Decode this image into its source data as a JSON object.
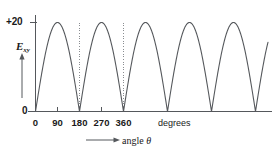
{
  "chart_data": {
    "type": "line",
    "title": "",
    "subtitle": "",
    "xlabel": "angle θ",
    "ylabel": "E",
    "ylabel_subscript": "xy",
    "xunit": "degrees",
    "xlim": [
      -10,
      810
    ],
    "ylim": [
      0,
      20
    ],
    "xticks": [
      0,
      90,
      180,
      270,
      360
    ],
    "xticklabels": [
      "0",
      "90",
      "180",
      "270",
      "360"
    ],
    "yticks": [
      0,
      20
    ],
    "yticklabels": [
      "0",
      "+20"
    ],
    "grid": false,
    "legend": null,
    "curve_description": "full-wave rectified sine: E = 20 |sin(θ)|",
    "amplitude": 20,
    "period_degrees": 180,
    "peaks_at_degrees": [
      0,
      180,
      360,
      540,
      720
    ],
    "zeros_at_degrees": [
      90,
      270,
      450,
      630
    ],
    "annotation_lines_degrees": [
      180,
      360
    ],
    "annotation_line_style": "dotted",
    "series": [
      {
        "name": "E_xy",
        "x": [
          0,
          10,
          20,
          30,
          40,
          50,
          60,
          70,
          80,
          90,
          100,
          110,
          120,
          130,
          140,
          150,
          160,
          170,
          180,
          190,
          200,
          210,
          220,
          230,
          240,
          250,
          260,
          270,
          280,
          290,
          300,
          310,
          320,
          330,
          340,
          350,
          360,
          370,
          380,
          390,
          400,
          410,
          420,
          430,
          440,
          450,
          460,
          470,
          480,
          490,
          500,
          510,
          520,
          530,
          540,
          550,
          560,
          570,
          580,
          590,
          600,
          610,
          620,
          630,
          640,
          650,
          660,
          670,
          680,
          690,
          700,
          710,
          720,
          730,
          740,
          750,
          760,
          770,
          780,
          790,
          800,
          810
        ],
        "y": [
          20.0,
          19.7,
          18.8,
          17.3,
          15.3,
          12.9,
          10.0,
          6.8,
          3.5,
          0.0,
          3.5,
          6.8,
          10.0,
          12.9,
          15.3,
          17.3,
          18.8,
          19.7,
          20.0,
          19.7,
          18.8,
          17.3,
          15.3,
          12.9,
          10.0,
          6.8,
          3.5,
          0.0,
          3.5,
          6.8,
          10.0,
          12.9,
          15.3,
          17.3,
          18.8,
          19.7,
          20.0,
          19.7,
          18.8,
          17.3,
          15.3,
          12.9,
          10.0,
          6.8,
          3.5,
          0.0,
          3.5,
          6.8,
          10.0,
          12.9,
          15.3,
          17.3,
          18.8,
          19.7,
          20.0,
          19.7,
          18.8,
          17.3,
          15.3,
          12.9,
          10.0,
          6.8,
          3.5,
          0.0,
          3.5,
          6.8,
          10.0,
          12.9,
          15.3,
          17.3,
          18.8,
          19.7,
          20.0,
          19.7,
          18.8,
          17.3,
          15.3,
          12.9,
          10.0,
          6.8,
          3.5,
          0.0
        ]
      }
    ],
    "colors": {
      "curve": "#55585c",
      "axis": "#55585c",
      "annotation": "#8a8d91",
      "text": "#1a1a1a",
      "background": "#ffffff"
    }
  },
  "axes": {
    "y_max_label": "+20",
    "y_zero_label": "0",
    "y_title_main": "E",
    "y_title_sub": "xy",
    "x_unit_label": "degrees",
    "x_title": "angle θ",
    "x_title_symbol": "θ",
    "x_title_word": "angle"
  },
  "ticks": [
    {
      "label": "0",
      "value": 0
    },
    {
      "label": "90",
      "value": 90
    },
    {
      "label": "180",
      "value": 180
    },
    {
      "label": "270",
      "value": 270
    },
    {
      "label": "360",
      "value": 360
    }
  ]
}
